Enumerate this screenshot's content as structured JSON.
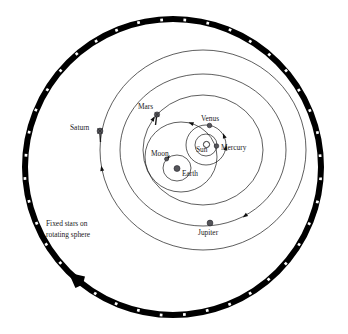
{
  "diagram": {
    "caption_line1": "Fixed stars on",
    "caption_line2": "rotating sphere",
    "colors": {
      "ring": "#000000",
      "star": "#ffffff",
      "orbit": "#1a1a1a",
      "planet": "#55555a",
      "sun": "#ffffff",
      "background": "#ffffff"
    },
    "outer_sphere": {
      "name": "fixed-stars-sphere",
      "center_x": 173,
      "center_y": 167,
      "radius": 148,
      "band_width": 6,
      "star_count": 40,
      "rotation_direction": "counterclockwise"
    },
    "bodies": [
      {
        "key": "sun",
        "label": "Sun",
        "x": 206.5,
        "y": 144.5,
        "r": 3.1,
        "label_x": 196,
        "label_y": 152,
        "anchor": "start"
      },
      {
        "key": "mercury",
        "label": "Mercury",
        "x": 216.5,
        "y": 146.0,
        "r": 2.3,
        "label_x": 221,
        "label_y": 150,
        "anchor": "start"
      },
      {
        "key": "venus",
        "label": "Venus",
        "x": 209.5,
        "y": 125.5,
        "r": 2.3,
        "label_x": 201,
        "label_y": 121,
        "anchor": "start"
      },
      {
        "key": "earth",
        "label": "Earth",
        "x": 177.0,
        "y": 168.5,
        "r": 3.0,
        "label_x": 182,
        "label_y": 176,
        "anchor": "start"
      },
      {
        "key": "moon",
        "label": "Moon",
        "x": 166.5,
        "y": 159.0,
        "r": 2.0,
        "label_x": 151,
        "label_y": 156,
        "anchor": "start"
      },
      {
        "key": "mars",
        "label": "Mars",
        "x": 157.0,
        "y": 114.5,
        "r": 2.6,
        "label_x": 138,
        "label_y": 109,
        "anchor": "start"
      },
      {
        "key": "jupiter",
        "label": "Jupiter",
        "x": 210.0,
        "y": 223.0,
        "r": 2.9,
        "label_x": 198,
        "label_y": 235,
        "anchor": "start"
      },
      {
        "key": "saturn",
        "label": "Saturn",
        "x": 100.0,
        "y": 131.0,
        "r": 2.9,
        "label_x": 70,
        "label_y": 130,
        "anchor": "start"
      }
    ],
    "orbits": [
      {
        "key": "saturn-orbit",
        "cx": 203,
        "cy": 150,
        "rx": 103,
        "ry": 100
      },
      {
        "key": "jupiter-orbit",
        "cx": 203,
        "cy": 150,
        "rx": 83,
        "ry": 76
      },
      {
        "key": "mars-orbit",
        "cx": 203,
        "cy": 150,
        "rx": 60,
        "ry": 55
      },
      {
        "key": "sun-orbit",
        "cx": 181,
        "cy": 157,
        "rx": 36,
        "ry": 35
      },
      {
        "key": "venus-orbit",
        "cx": 206,
        "cy": 145,
        "rx": 20,
        "ry": 20
      },
      {
        "key": "mercury-orbit",
        "cx": 206,
        "cy": 145,
        "rx": 11,
        "ry": 11
      },
      {
        "key": "moon-orbit",
        "cx": 177,
        "cy": 168,
        "rx": 14,
        "ry": 13
      }
    ]
  }
}
